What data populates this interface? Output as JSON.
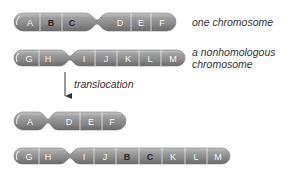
{
  "diagram": {
    "colors": {
      "chromosome_body": "#8c8c8c",
      "chromosome_highlight": "#b5b5b5",
      "chromosome_shadow": "#6e6e6e",
      "band_line": "#e6e6e6",
      "label_text": "#333333",
      "arrow": "#333333"
    },
    "chromosomes": [
      {
        "id": "one-chromosome",
        "caption": "one chromosome",
        "bands": [
          "A",
          "B",
          "C",
          "D",
          "E",
          "F"
        ],
        "centromere_after": "C"
      },
      {
        "id": "nonhomologous-chromosome",
        "caption_line1": "a nonhomologous",
        "caption_line2": "chromosome",
        "bands": [
          "G",
          "H",
          "I",
          "J",
          "K",
          "L",
          "M"
        ],
        "centromere_after": "H"
      },
      {
        "id": "result-chromosome-1",
        "bands": [
          "A",
          "D",
          "E",
          "F"
        ],
        "centromere_after": "A"
      },
      {
        "id": "result-chromosome-2",
        "bands": [
          "G",
          "H",
          "I",
          "J",
          "B",
          "C",
          "K",
          "L",
          "M"
        ],
        "centromere_after": "H",
        "translocated_bands": [
          "B",
          "C"
        ]
      }
    ],
    "arrow": {
      "label": "translocation",
      "direction": "down"
    }
  }
}
